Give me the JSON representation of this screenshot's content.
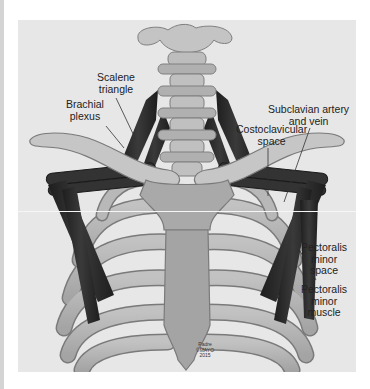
{
  "figure": {
    "labels": {
      "scalene_triangle": "Scalene\ntriangle",
      "brachial_plexus": "Brachial\nplexus",
      "subclavian": "Subclavian artery\nand vein",
      "costoclavicular": "Costoclavicular\nspace",
      "pectoralis_space": "Pectoralis\nminor\nspace",
      "pectoralis_muscle": "Pectoralis\nminor\nmuscle"
    },
    "credit": "Padre\n©MAYO\n2015",
    "watermark": "Neu\nthe Syn"
  },
  "colors": {
    "background": "#e7e7e7",
    "bone": "#b0b0b0",
    "bone_dark": "#8c8c8c",
    "muscle": "#2b2b2b",
    "outline": "#6a6a6a"
  }
}
